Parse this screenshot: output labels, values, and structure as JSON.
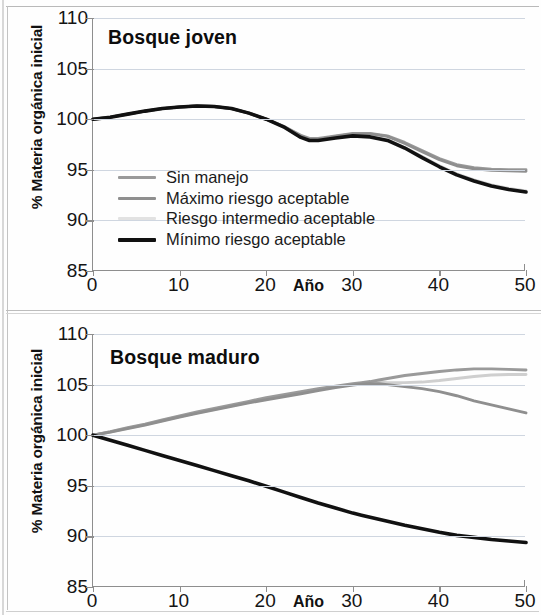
{
  "figure": {
    "axis_title_y": "% Materia orgánica inicial",
    "axis_title_x": "Año",
    "y_ticks": [
      "85",
      "90",
      "95",
      "100",
      "105",
      "110"
    ],
    "x_ticks": [
      "0",
      "10",
      "20",
      "30",
      "40",
      "50"
    ],
    "panels": [
      {
        "title": "Bosque joven"
      },
      {
        "title": "Bosque maduro"
      }
    ],
    "legend": [
      {
        "label": "Sin manejo",
        "color": "#9a9a9a"
      },
      {
        "label": "Máximo riesgo aceptable",
        "color": "#8f8f8f"
      },
      {
        "label": "Riesgo intermedio aceptable",
        "color": "#e2e2e2"
      },
      {
        "label": "Mínimo riesgo aceptable",
        "color": "#111111"
      }
    ]
  },
  "chart_data": [
    {
      "type": "line",
      "title": "Bosque joven",
      "xlabel": "Año",
      "ylabel": "% Materia orgánica inicial",
      "xlim": [
        0,
        50
      ],
      "ylim": [
        85,
        110
      ],
      "y_ticks": [
        85,
        90,
        95,
        100,
        105,
        110
      ],
      "x_ticks": [
        0,
        10,
        20,
        30,
        40,
        50
      ],
      "grid": true,
      "legend_position": "inside-lower-left",
      "x": [
        0,
        2,
        4,
        6,
        8,
        10,
        12,
        14,
        16,
        18,
        20,
        22,
        24,
        25,
        26,
        28,
        30,
        32,
        34,
        36,
        38,
        40,
        42,
        44,
        46,
        48,
        50
      ],
      "series": [
        {
          "name": "Sin manejo",
          "color": "#9a9a9a",
          "values": [
            100.0,
            100.2,
            100.5,
            100.8,
            101.05,
            101.2,
            101.3,
            101.25,
            101.05,
            100.6,
            100.0,
            99.3,
            98.4,
            98.1,
            98.1,
            98.35,
            98.6,
            98.6,
            98.35,
            97.7,
            96.9,
            96.1,
            95.5,
            95.2,
            95.05,
            95.0,
            95.0
          ]
        },
        {
          "name": "Máximo riesgo aceptable",
          "color": "#8f8f8f",
          "values": [
            100.0,
            100.2,
            100.5,
            100.8,
            101.05,
            101.2,
            101.3,
            101.25,
            101.05,
            100.6,
            100.0,
            99.3,
            98.35,
            98.0,
            98.0,
            98.3,
            98.55,
            98.55,
            98.3,
            97.6,
            96.8,
            96.0,
            95.4,
            95.1,
            94.95,
            94.9,
            94.85
          ]
        },
        {
          "name": "Riesgo intermedio aceptable",
          "color": "#cfcfcf",
          "values": [
            100.0,
            100.2,
            100.5,
            100.8,
            101.05,
            101.2,
            101.3,
            101.25,
            101.05,
            100.6,
            100.0,
            99.25,
            98.25,
            97.95,
            97.95,
            98.2,
            98.4,
            98.3,
            97.95,
            97.2,
            96.3,
            95.4,
            94.6,
            94.0,
            93.5,
            93.15,
            92.9
          ]
        },
        {
          "name": "Mínimo riesgo aceptable",
          "color": "#111111",
          "values": [
            100.0,
            100.2,
            100.5,
            100.8,
            101.05,
            101.2,
            101.3,
            101.25,
            101.05,
            100.6,
            100.0,
            99.25,
            98.2,
            97.9,
            97.9,
            98.15,
            98.35,
            98.25,
            97.9,
            97.15,
            96.2,
            95.3,
            94.5,
            93.9,
            93.4,
            93.05,
            92.8
          ]
        }
      ]
    },
    {
      "type": "line",
      "title": "Bosque maduro",
      "xlabel": "Año",
      "ylabel": "% Materia orgánica inicial",
      "xlim": [
        0,
        50
      ],
      "ylim": [
        85,
        110
      ],
      "y_ticks": [
        85,
        90,
        95,
        100,
        105,
        110
      ],
      "x_ticks": [
        0,
        10,
        20,
        30,
        40,
        50
      ],
      "grid": true,
      "legend_position": "none",
      "x": [
        0,
        2,
        4,
        6,
        8,
        10,
        12,
        14,
        16,
        18,
        20,
        22,
        24,
        26,
        28,
        30,
        31,
        32,
        33,
        34,
        36,
        38,
        40,
        42,
        44,
        46,
        48,
        50
      ],
      "series": [
        {
          "name": "Sin manejo",
          "color": "#9a9a9a",
          "values": [
            100.0,
            100.35,
            100.75,
            101.1,
            101.5,
            101.9,
            102.3,
            102.65,
            103.0,
            103.35,
            103.7,
            104.0,
            104.3,
            104.6,
            104.85,
            105.1,
            105.2,
            105.3,
            105.45,
            105.6,
            105.9,
            106.1,
            106.3,
            106.45,
            106.55,
            106.55,
            106.5,
            106.45
          ]
        },
        {
          "name": "Máximo riesgo aceptable",
          "color": "#8f8f8f",
          "values": [
            100.0,
            100.3,
            100.65,
            101.0,
            101.4,
            101.8,
            102.15,
            102.5,
            102.85,
            103.2,
            103.5,
            103.8,
            104.1,
            104.4,
            104.7,
            104.95,
            105.05,
            105.1,
            105.1,
            105.0,
            104.8,
            104.6,
            104.3,
            103.9,
            103.4,
            103.0,
            102.6,
            102.2
          ]
        },
        {
          "name": "Riesgo intermedio aceptable",
          "color": "#cfcfcf",
          "values": [
            100.0,
            100.32,
            100.7,
            101.05,
            101.45,
            101.85,
            102.2,
            102.55,
            102.9,
            103.25,
            103.6,
            103.9,
            104.2,
            104.5,
            104.78,
            105.0,
            105.1,
            105.2,
            105.25,
            105.2,
            105.2,
            105.25,
            105.4,
            105.6,
            105.8,
            105.95,
            106.0,
            106.0
          ]
        },
        {
          "name": "Mínimo riesgo aceptable",
          "color": "#111111",
          "values": [
            100.0,
            99.5,
            99.0,
            98.5,
            98.0,
            97.5,
            97.0,
            96.5,
            96.0,
            95.5,
            94.95,
            94.4,
            93.85,
            93.3,
            92.8,
            92.3,
            92.1,
            91.9,
            91.7,
            91.5,
            91.1,
            90.75,
            90.4,
            90.1,
            89.9,
            89.7,
            89.55,
            89.4
          ]
        }
      ]
    }
  ]
}
